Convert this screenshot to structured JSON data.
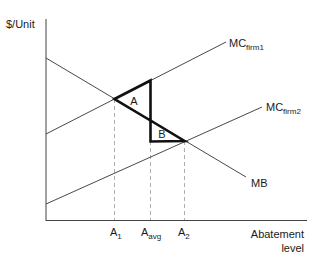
{
  "diagram": {
    "y_axis_label": "$/Unit",
    "x_axis_label_line1": "Abatement",
    "x_axis_label_line2": "level",
    "curves": {
      "mc_firm1": {
        "main": "MC",
        "sub": "firm1"
      },
      "mc_firm2": {
        "main": "MC",
        "sub": "firm2"
      },
      "mb": {
        "main": "MB"
      }
    },
    "regions": {
      "a": "A",
      "b": "B"
    },
    "x_ticks": [
      {
        "main": "A",
        "sub": "1"
      },
      {
        "main": "A",
        "sub": "avg"
      },
      {
        "main": "A",
        "sub": "2"
      }
    ],
    "colors": {
      "line": "#333333",
      "thick": "#111111",
      "dashed": "#999999"
    }
  }
}
